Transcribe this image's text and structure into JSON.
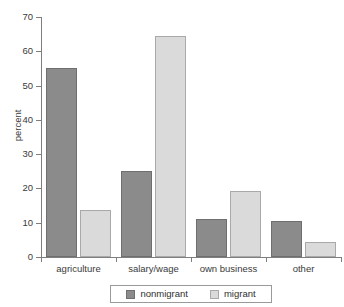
{
  "chart_data": {
    "type": "bar",
    "title": "",
    "subtitle": "",
    "xlabel": "",
    "ylabel": "percent",
    "ylim": [
      0,
      70
    ],
    "yticks": [
      0,
      10,
      20,
      30,
      40,
      50,
      60,
      70
    ],
    "ytick_labels": [
      "0",
      "10",
      "20",
      "30",
      "40",
      "50",
      "60",
      "70"
    ],
    "grid": false,
    "legend_position": "bottom-center",
    "categories": [
      "agriculture",
      "salary/wage",
      "own business",
      "other"
    ],
    "series": [
      {
        "name": "nonmigrant",
        "color": "#8b8b8b",
        "values": [
          55,
          25,
          11,
          10.5
        ]
      },
      {
        "name": "migrant",
        "color": "#dadada",
        "values": [
          13.8,
          64.5,
          19.2,
          4.5
        ]
      }
    ]
  },
  "legend": {
    "entries": [
      {
        "label": "nonmigrant",
        "swatch": "nonmigrant-swatch"
      },
      {
        "label": "migrant",
        "swatch": "migrant-swatch"
      }
    ]
  }
}
